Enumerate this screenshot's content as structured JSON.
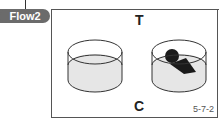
{
  "tab": {
    "label": "Flow2"
  },
  "labels": {
    "top": "T",
    "bottom": "C"
  },
  "figure_id": "5-7-2",
  "diagram": {
    "left_cylinder": {
      "state": "empty",
      "fill": "#e6e6e6",
      "stroke": "#333333"
    },
    "right_cylinder": {
      "state": "with-dark-object",
      "fill": "#e6e6e6",
      "stroke": "#333333",
      "object_color": "#1a1a1a"
    }
  },
  "colors": {
    "tab_bg": "#6b6b6b",
    "tab_text": "#ffffff",
    "frame": "#555555"
  }
}
